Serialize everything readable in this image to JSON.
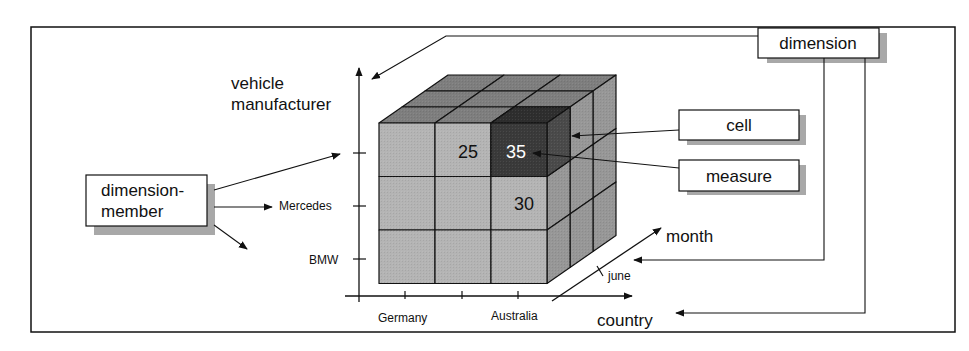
{
  "diagram": {
    "title": "",
    "axes": {
      "vertical": {
        "label_line1": "vehicle",
        "label_line2": "manufacturer",
        "ticks": [
          "",
          "Mercedes",
          "BMW"
        ]
      },
      "horizontal": {
        "label": "country",
        "ticks": [
          "Germany",
          "",
          "Australia"
        ]
      },
      "depth": {
        "label": "month",
        "ticks": [
          "june"
        ]
      }
    },
    "callouts": {
      "dimension": "dimension",
      "dimension_member_line1": "dimension-",
      "dimension_member_line2": "member",
      "cell": "cell",
      "measure": "measure"
    },
    "cells": {
      "top_middle": "25",
      "top_right_highlighted": "35",
      "middle_right": "30"
    },
    "colors": {
      "front_face": "#b4b4b4",
      "top_face": "#7e7e7e",
      "side_face": "#979797",
      "highlight_cell": "#3a3a3a",
      "highlight_text": "#ffffff",
      "line": "#111111"
    }
  }
}
